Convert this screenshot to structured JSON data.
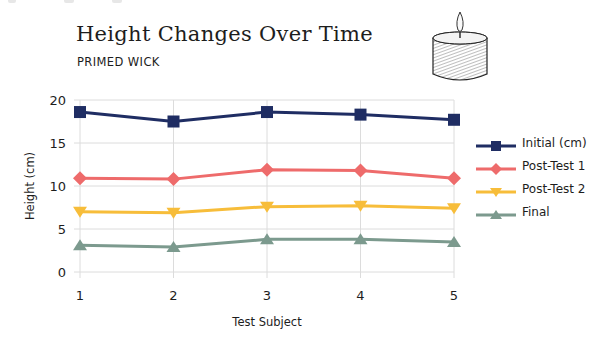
{
  "header": {
    "title": "Height Changes Over Time",
    "subtitle": "PRIMED WICK",
    "illustration": "candle-icon"
  },
  "chart_data": {
    "type": "line",
    "title": "Height Changes Over Time",
    "subtitle": "PRIMED WICK",
    "xlabel": "Test Subject",
    "ylabel": "Height (cm)",
    "x": [
      1,
      2,
      3,
      4,
      5
    ],
    "categories": [
      "1",
      "2",
      "3",
      "4",
      "5"
    ],
    "yticks": [
      0,
      5,
      10,
      15,
      20
    ],
    "ylim": [
      0,
      20
    ],
    "grid": true,
    "legend_position": "right",
    "series": [
      {
        "name": "Initial (cm)",
        "color": "#1f2d63",
        "marker": "square",
        "values": [
          18.6,
          17.5,
          18.6,
          18.3,
          17.7
        ]
      },
      {
        "name": "Post-Test 1",
        "color": "#ee6b6b",
        "marker": "diamond",
        "values": [
          10.9,
          10.8,
          11.9,
          11.8,
          10.9
        ]
      },
      {
        "name": "Post-Test 2",
        "color": "#f7bd3a",
        "marker": "triangle-down",
        "values": [
          7.0,
          6.9,
          7.6,
          7.7,
          7.4
        ]
      },
      {
        "name": "Final",
        "color": "#7c9a8e",
        "marker": "triangle-up",
        "values": [
          3.1,
          2.9,
          3.8,
          3.8,
          3.5
        ]
      }
    ]
  }
}
